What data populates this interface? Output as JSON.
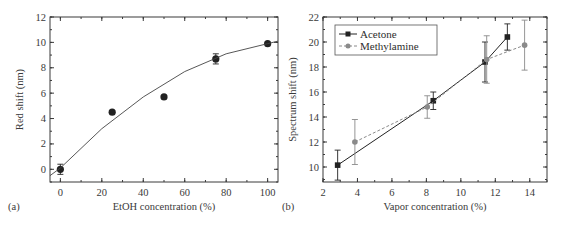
{
  "chart_data": [
    {
      "panel": "(a)",
      "type": "scatter",
      "title": "",
      "xlabel": "EtOH concentration (%)",
      "ylabel": "Red shift (nm)",
      "xlim": [
        -5,
        105
      ],
      "ylim": [
        -1,
        12
      ],
      "xticks": [
        0,
        20,
        40,
        60,
        80,
        100
      ],
      "yticks": [
        0,
        2,
        4,
        6,
        8,
        10,
        12
      ],
      "grid": false,
      "legend": null,
      "series": [
        {
          "name": "Measured",
          "marker": "circle",
          "color": "#222222",
          "x": [
            0,
            25,
            50,
            75,
            100
          ],
          "y": [
            0.0,
            4.5,
            5.7,
            8.7,
            9.9
          ],
          "yerr": [
            0.4,
            0.1,
            0.1,
            0.4,
            0.1
          ]
        },
        {
          "name": "Fit",
          "style": "line",
          "color": "#444444",
          "x": [
            -5,
            0,
            20,
            40,
            60,
            80,
            100,
            105
          ],
          "y": [
            -0.5,
            0.1,
            3.2,
            5.7,
            7.7,
            9.1,
            9.9,
            10.1
          ]
        }
      ]
    },
    {
      "panel": "(b)",
      "type": "line",
      "title": "",
      "xlabel": "Vapor concentration (%)",
      "ylabel": "Spectrum shift (nm)",
      "xlim": [
        2,
        15
      ],
      "ylim": [
        8.8,
        22
      ],
      "xticks": [
        2,
        4,
        6,
        8,
        10,
        12,
        14
      ],
      "yticks": [
        10,
        12,
        14,
        16,
        18,
        20,
        22
      ],
      "grid": false,
      "legend": {
        "position": "upper left",
        "entries": [
          "Acetone",
          "Methylamine"
        ]
      },
      "series": [
        {
          "name": "Acetone",
          "marker": "square",
          "linestyle": "solid",
          "color": "#222222",
          "x": [
            2.85,
            8.4,
            11.4,
            12.7
          ],
          "y": [
            10.15,
            15.3,
            18.4,
            20.4
          ],
          "yerr": [
            1.2,
            0.7,
            1.6,
            1.05
          ]
        },
        {
          "name": "Methylamine",
          "marker": "circle",
          "linestyle": "dashed",
          "color": "#8a8a8a",
          "x": [
            3.85,
            8.05,
            11.5,
            13.7
          ],
          "y": [
            12.0,
            14.8,
            18.6,
            19.75
          ],
          "yerr": [
            1.8,
            0.9,
            1.9,
            2.0
          ]
        }
      ]
    }
  ]
}
